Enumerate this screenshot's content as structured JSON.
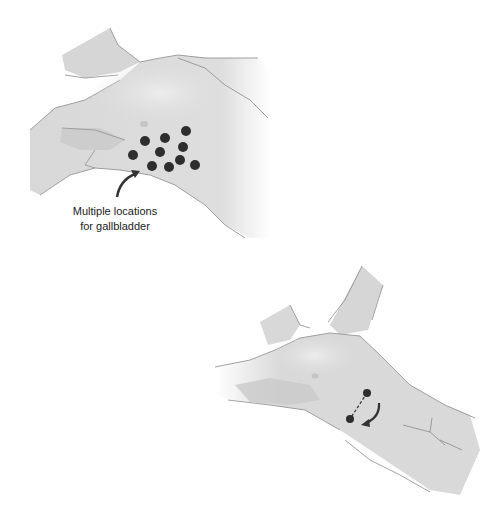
{
  "figure": {
    "panels": [
      {
        "id": "top",
        "description": "Patient torso in supine position showing multiple port locations",
        "annotation": {
          "line1": "Multiple locations",
          "line2": "for gallbladder"
        },
        "port_dots": [
          [
            186,
            131
          ],
          [
            145,
            141
          ],
          [
            165,
            138
          ],
          [
            183,
            147
          ],
          [
            160,
            152
          ],
          [
            133,
            155
          ],
          [
            180,
            160
          ],
          [
            152,
            166
          ],
          [
            169,
            167
          ],
          [
            195,
            165
          ]
        ]
      },
      {
        "id": "bottom",
        "description": "Patient torso with two ports connected by dashed line and rotation arrow",
        "port_dots": [
          [
            367,
            393
          ],
          [
            350,
            419
          ]
        ]
      }
    ],
    "colors": {
      "skin": "#dcdcdc",
      "skin_shadow": "#c8c8c8",
      "outline": "#8a8a8a",
      "dot": "#2e2e2e",
      "arrow": "#333333"
    }
  }
}
